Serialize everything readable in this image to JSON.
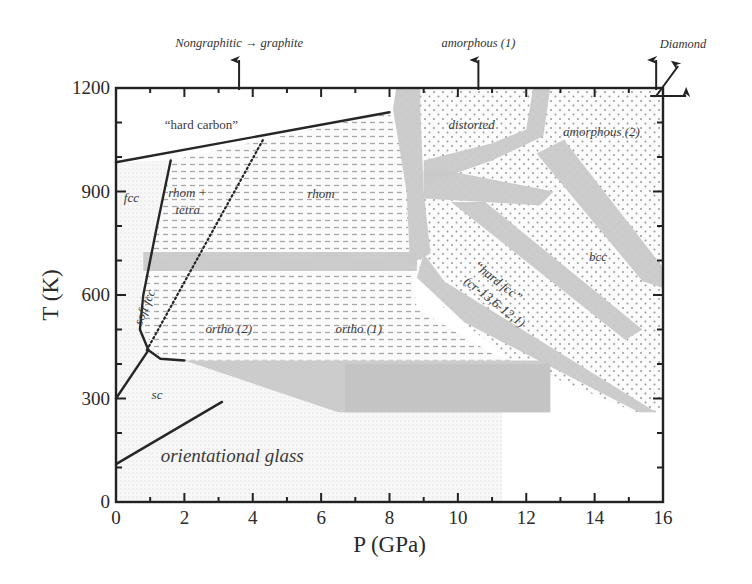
{
  "chart_data": {
    "type": "phase-diagram",
    "title": "",
    "xlabel": "P (GPa)",
    "ylabel": "T (K)",
    "xlim": [
      0,
      16
    ],
    "ylim": [
      0,
      1200
    ],
    "x_ticks": [
      0,
      2,
      4,
      6,
      8,
      10,
      12,
      14,
      16
    ],
    "x_tick_labels": [
      "0",
      "2",
      "4",
      "6",
      "8",
      "10",
      "12",
      "14",
      "16"
    ],
    "y_ticks": [
      0,
      300,
      600,
      900,
      1200
    ],
    "y_tick_labels": [
      "0",
      "300",
      "600",
      "900",
      "1200"
    ],
    "grid": false,
    "top_annotations": [
      {
        "text": "Nongraphitic → graphite",
        "P": 3.6
      },
      {
        "text": "amorphous (1)",
        "P": 10.6
      },
      {
        "text": "Diamond",
        "P": 15.8
      }
    ],
    "regions": [
      {
        "label": "“hard carbon”",
        "P": 2.5,
        "T": 1080,
        "style": "plain"
      },
      {
        "label": "fcc",
        "P": 0.45,
        "T": 870
      },
      {
        "label": "rhom + tetra",
        "P": 2.1,
        "T": 885
      },
      {
        "label": "rhom",
        "P": 6.0,
        "T": 880
      },
      {
        "label": "distorted",
        "P": 10.4,
        "T": 1080
      },
      {
        "label": "amorphous (2)",
        "P": 14.2,
        "T": 1060
      },
      {
        "label": "bcc",
        "P": 14.1,
        "T": 700
      },
      {
        "label": "“hard fcc”",
        "P": 11.1,
        "T": 630
      },
      {
        "label": "(cr-13,6-12,1)",
        "P": 11.0,
        "T": 570
      },
      {
        "label": "soft fcc",
        "P": 0.95,
        "T": 560
      },
      {
        "label": "ortho (2)",
        "P": 3.3,
        "T": 490
      },
      {
        "label": "ortho (1)",
        "P": 7.1,
        "T": 490
      },
      {
        "label": "sc",
        "P": 1.2,
        "T": 300
      },
      {
        "label": "orientational glass",
        "P": 3.4,
        "T": 115,
        "style": "big"
      }
    ],
    "boundaries": [
      {
        "name": "hard-carbon-boundary",
        "points": [
          [
            0,
            985
          ],
          [
            8,
            1130
          ]
        ],
        "style": "solid"
      },
      {
        "name": "fcc-boundary",
        "points": [
          [
            1.6,
            990
          ],
          [
            1.2,
            800
          ],
          [
            0.8,
            600
          ],
          [
            0.7,
            500
          ],
          [
            0.95,
            440
          ],
          [
            1.3,
            415
          ],
          [
            2.0,
            410
          ]
        ],
        "style": "solid"
      },
      {
        "name": "sc-upper-boundary",
        "points": [
          [
            0,
            300
          ],
          [
            0.95,
            440
          ]
        ],
        "style": "solid"
      },
      {
        "name": "sc-lower-boundary",
        "points": [
          [
            0,
            110
          ],
          [
            3.1,
            290
          ]
        ],
        "style": "solid"
      },
      {
        "name": "soft-fcc-boundary",
        "points": [
          [
            0.9,
            440
          ],
          [
            4.3,
            1050
          ]
        ],
        "style": "dotted"
      }
    ]
  }
}
